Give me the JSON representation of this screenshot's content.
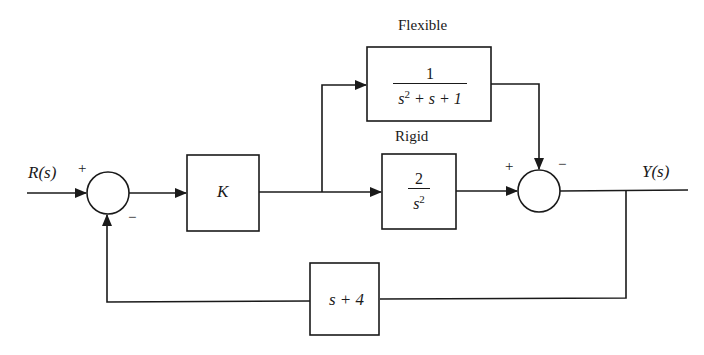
{
  "diagram": {
    "type": "block-diagram",
    "input_label": "R(s)",
    "output_label": "Y(s)",
    "blocks": {
      "controller": {
        "label": "K"
      },
      "flexible": {
        "title": "Flexible",
        "numerator": "1",
        "denominator_base": "s",
        "denominator_exp": "2",
        "denominator_rest": " + s + 1"
      },
      "rigid": {
        "title": "Rigid",
        "numerator": "2",
        "denominator_base": "s",
        "denominator_exp": "2"
      },
      "feedback": {
        "label": "s + 4"
      }
    },
    "junctions": {
      "sum1": {
        "plus_sign": "+",
        "minus_sign": "−"
      },
      "sum2": {
        "plus_sign": "+",
        "minus_sign": "−"
      }
    },
    "colors": {
      "line": "#1a1a1a",
      "background": "#ffffff"
    }
  }
}
